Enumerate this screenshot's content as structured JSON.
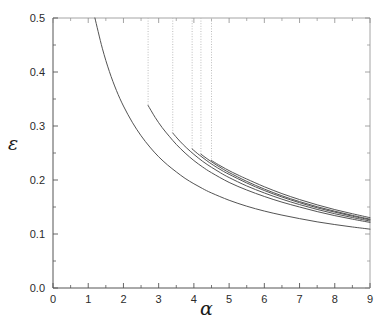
{
  "figure": {
    "background_color": "#ffffff",
    "axis_color": "#555555",
    "curve_color": "#4a4a4a",
    "dotted_color": "#bdbdbd",
    "plot_left_px": 53,
    "plot_right_px": 370,
    "plot_top_px": 18,
    "plot_bottom_px": 288
  },
  "labels": {
    "ylabel": "ε",
    "xlabel": "α",
    "ylabel_name": "epsilon",
    "xlabel_name": "alpha"
  },
  "chart_data": {
    "type": "line",
    "title": "",
    "subtitle": "",
    "xlabel": "α",
    "ylabel": "ε",
    "xlim": [
      0,
      9
    ],
    "ylim": [
      0.0,
      0.5
    ],
    "xticks": [
      0,
      1,
      2,
      3,
      4,
      5,
      6,
      7,
      8,
      9
    ],
    "xticklabels": [
      "0",
      "1",
      "2",
      "3",
      "4",
      "5",
      "6",
      "7",
      "8",
      "9"
    ],
    "yticks": [
      0.0,
      0.1,
      0.2,
      0.3,
      0.4,
      0.5
    ],
    "yticklabels": [
      "0.0",
      "0.1",
      "0.2",
      "0.3",
      "0.4",
      "0.5"
    ],
    "minor_xticks": [
      0.5,
      1.5,
      2.5,
      3.5,
      4.5,
      5.5,
      6.5,
      7.5,
      8.5
    ],
    "minor_yticks": [
      0.05,
      0.15,
      0.25,
      0.35,
      0.45
    ],
    "grid": false,
    "legend": false,
    "legend_position": "none",
    "tick_direction": "in",
    "series": [
      {
        "name": "curve-1",
        "style": "solid",
        "x": [
          1.19,
          1.4,
          1.6,
          1.8,
          2.0,
          2.25,
          2.5,
          2.75,
          3.0,
          3.25,
          3.5,
          3.75,
          4.0,
          4.25,
          4.5,
          5.0,
          5.5,
          6.0,
          6.5,
          7.0,
          7.5,
          8.0,
          8.5,
          9.0
        ],
        "y": [
          0.5,
          0.444,
          0.401,
          0.366,
          0.337,
          0.307,
          0.282,
          0.261,
          0.243,
          0.228,
          0.215,
          0.203,
          0.193,
          0.184,
          0.176,
          0.1625,
          0.1515,
          0.1425,
          0.135,
          0.1285,
          0.1225,
          0.1175,
          0.113,
          0.109
        ]
      },
      {
        "name": "curve-2",
        "style": "solid",
        "x": [
          2.7,
          2.9,
          3.1,
          3.3,
          3.5,
          3.75,
          4.0,
          4.25,
          4.5,
          5.0,
          5.5,
          6.0,
          6.5,
          7.0,
          7.5,
          8.0,
          8.5,
          9.0
        ],
        "y": [
          0.338,
          0.316,
          0.297,
          0.281,
          0.266,
          0.25,
          0.236,
          0.224,
          0.2135,
          0.1955,
          0.1815,
          0.1695,
          0.159,
          0.15,
          0.1415,
          0.134,
          0.1275,
          0.1215
        ]
      },
      {
        "name": "curve-3",
        "style": "solid",
        "x": [
          3.4,
          3.6,
          3.8,
          4.0,
          4.25,
          4.5,
          4.75,
          5.0,
          5.5,
          6.0,
          6.5,
          7.0,
          7.5,
          8.0,
          8.5,
          9.0
        ],
        "y": [
          0.287,
          0.272,
          0.259,
          0.2475,
          0.2345,
          0.2235,
          0.2135,
          0.2045,
          0.189,
          0.176,
          0.1645,
          0.1545,
          0.1455,
          0.1375,
          0.1305,
          0.124
        ]
      },
      {
        "name": "curve-4",
        "style": "solid",
        "x": [
          3.95,
          4.15,
          4.35,
          4.55,
          4.8,
          5.0,
          5.5,
          6.0,
          6.5,
          7.0,
          7.5,
          8.0,
          8.5,
          9.0
        ],
        "y": [
          0.2575,
          0.2465,
          0.2365,
          0.2275,
          0.2175,
          0.2105,
          0.1945,
          0.1805,
          0.1685,
          0.158,
          0.1485,
          0.1405,
          0.133,
          0.1262
        ]
      },
      {
        "name": "curve-5",
        "style": "solid",
        "x": [
          4.2,
          4.4,
          4.6,
          4.8,
          5.0,
          5.5,
          6.0,
          6.5,
          7.0,
          7.5,
          8.0,
          8.5,
          9.0
        ],
        "y": [
          0.2478,
          0.2382,
          0.2294,
          0.2212,
          0.2138,
          0.1975,
          0.1832,
          0.1708,
          0.16,
          0.1505,
          0.1422,
          0.1345,
          0.1275
        ]
      },
      {
        "name": "curve-6",
        "style": "solid",
        "x": [
          4.5,
          4.7,
          4.9,
          5.1,
          5.3,
          5.5,
          6.0,
          6.5,
          7.0,
          7.5,
          8.0,
          8.5,
          9.0
        ],
        "y": [
          0.236,
          0.2282,
          0.2208,
          0.214,
          0.2078,
          0.2018,
          0.1875,
          0.1748,
          0.1638,
          0.154,
          0.1452,
          0.1375,
          0.1302
        ]
      }
    ],
    "vertical_dotted_lines": [
      {
        "name": "dropline-1",
        "x": 2.7,
        "y_top": 0.5,
        "y_bottom": 0.338
      },
      {
        "name": "dropline-2",
        "x": 3.4,
        "y_top": 0.5,
        "y_bottom": 0.287
      },
      {
        "name": "dropline-3",
        "x": 3.95,
        "y_top": 0.5,
        "y_bottom": 0.2575
      },
      {
        "name": "dropline-4",
        "x": 4.2,
        "y_top": 0.5,
        "y_bottom": 0.2478
      },
      {
        "name": "dropline-5",
        "x": 4.5,
        "y_top": 0.5,
        "y_bottom": 0.236
      }
    ],
    "annotations": []
  }
}
